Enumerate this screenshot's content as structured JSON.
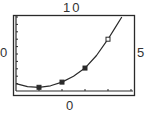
{
  "window_labels": {
    "ymax": "10",
    "xmin": "0",
    "xmax": "5",
    "ymin": "0"
  },
  "colors": {
    "frame": "#2a2a2a",
    "curve": "#2a2a2a",
    "background": "#ffffff"
  },
  "chart_data": {
    "type": "scatter",
    "title": "",
    "xlabel": "",
    "ylabel": "",
    "xlim": [
      0,
      5
    ],
    "ylim": [
      0,
      10
    ],
    "x_ticks": [
      1,
      2,
      3,
      4,
      5
    ],
    "y_tick_count": 10,
    "grid": false,
    "legend": null,
    "series": [
      {
        "name": "data points",
        "x": [
          1,
          2,
          3,
          4
        ],
        "y": [
          0.5,
          1.2,
          3.1,
          7.0
        ],
        "markers": [
          "filled",
          "filled",
          "filled",
          "open"
        ]
      },
      {
        "name": "fitted curve",
        "kind": "line",
        "x": [
          0,
          0.5,
          1,
          1.5,
          2,
          2.5,
          3,
          3.5,
          4,
          4.3,
          4.6
        ],
        "y": [
          1.0,
          0.6,
          0.5,
          0.7,
          1.2,
          2.0,
          3.1,
          4.8,
          7.0,
          8.5,
          10.0
        ]
      }
    ],
    "window_labels": {
      "top": "10",
      "left": "0",
      "right": "5",
      "bottom": "0"
    }
  }
}
